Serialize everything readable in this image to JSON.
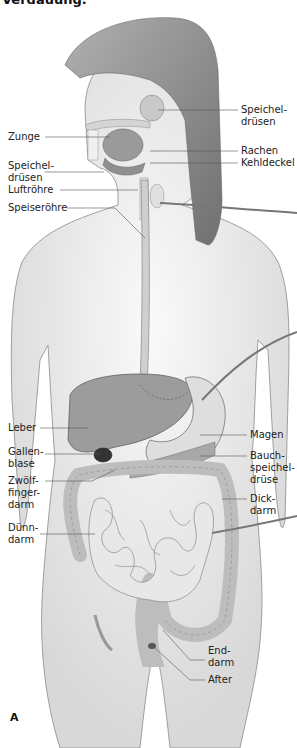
{
  "figure": {
    "heading_fragment": "Verdauung.",
    "panel_letter": "A",
    "colors": {
      "body_fill": "#e6e6e6",
      "body_stroke": "#8a8a8a",
      "hair": "#8c8c8c",
      "organ_dark": "#9a9a9a",
      "organ_light": "#c8c8c8",
      "leader_line": "#555555"
    },
    "labels_left": [
      {
        "id": "zunge",
        "text": "Zunge"
      },
      {
        "id": "speicheldruesen_unten",
        "text": "Speichel-\ndrüsen"
      },
      {
        "id": "luftroehre",
        "text": "Luftröhre"
      },
      {
        "id": "speiseroehre",
        "text": "Speiseröhre"
      },
      {
        "id": "leber",
        "text": "Leber"
      },
      {
        "id": "gallenblase",
        "text": "Gallen-\nblase"
      },
      {
        "id": "zwoelffingerdarm",
        "text": "Zwölf-\nfinger-\ndarm"
      },
      {
        "id": "duenndarm",
        "text": "Dünn-\ndarm"
      }
    ],
    "labels_right": [
      {
        "id": "speicheldruesen_oben",
        "text": "Speichel-\ndrüsen"
      },
      {
        "id": "rachen",
        "text": "Rachen"
      },
      {
        "id": "kehldeckel",
        "text": "Kehldeckel"
      },
      {
        "id": "magen",
        "text": "Magen"
      },
      {
        "id": "bauchspeicheldruese",
        "text": "Bauch-\nspeichel-\ndrüse"
      },
      {
        "id": "dickdarm",
        "text": "Dick-\ndarm"
      },
      {
        "id": "enddarm",
        "text": "End-\ndarm"
      },
      {
        "id": "after",
        "text": "After"
      }
    ]
  }
}
